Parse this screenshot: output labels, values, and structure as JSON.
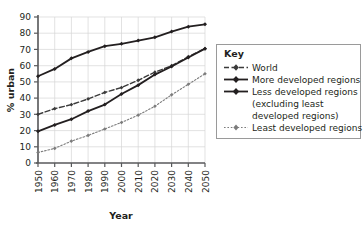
{
  "chart_data": {
    "type": "line",
    "title": "",
    "xlabel": "Year",
    "ylabel": "% urban",
    "x": [
      1950,
      1960,
      1970,
      1980,
      1990,
      2000,
      2010,
      2020,
      2030,
      2040,
      2050
    ],
    "xtick_labels": [
      "1950",
      "1960",
      "1970",
      "1980",
      "1990",
      "2000",
      "2010",
      "2020",
      "2030",
      "2040",
      "2050"
    ],
    "ytick_labels": [
      "0",
      "10",
      "20",
      "30",
      "40",
      "50",
      "60",
      "70",
      "80",
      "90"
    ],
    "xlim": [
      1950,
      2050
    ],
    "ylim": [
      0,
      90
    ],
    "grid": true,
    "legend_position": "right",
    "series": [
      {
        "name": "World",
        "style": "dashed",
        "color": "#3b3b3b",
        "marker": "diamond",
        "values": [
          30,
          33.5,
          36,
          39.5,
          43.5,
          46.5,
          51,
          56,
          60,
          65.5,
          70.5
        ]
      },
      {
        "name": "More developed regions",
        "style": "solid",
        "color": "#231f20",
        "marker": "diamond",
        "values": [
          53.5,
          58,
          64.5,
          68.5,
          72,
          73.5,
          75.5,
          77.5,
          81,
          84,
          85.5
        ]
      },
      {
        "name": "Less developed regions (excluding least developed regions)",
        "style": "solid",
        "color": "#231f20",
        "marker": "diamond",
        "values": [
          19.5,
          23.5,
          27,
          32,
          36,
          42.5,
          48,
          54.5,
          59.5,
          65,
          70.5
        ]
      },
      {
        "name": "Least developed regions",
        "style": "dotted",
        "color": "#7c7c7c",
        "marker": "diamond",
        "values": [
          6.5,
          9,
          13.5,
          17,
          21,
          25,
          29.5,
          35,
          42,
          48.5,
          55
        ]
      }
    ]
  },
  "legend": {
    "title": "Key",
    "items": [
      {
        "label": "World"
      },
      {
        "label": "More developed regions"
      },
      {
        "label": "Less developed regions"
      },
      {
        "label": "(excluding least"
      },
      {
        "label": "developed regions)"
      },
      {
        "label": "Least developed regions"
      }
    ]
  },
  "colors": {
    "axis": "#58595b",
    "grid": "#d6d6d6",
    "text": "#231f20",
    "world_line": "#3b3b3b",
    "more_developed_line": "#231f20",
    "less_developed_line": "#231f20",
    "least_developed_line": "#7c7c7c",
    "legend_border": "#9a9a9a"
  }
}
